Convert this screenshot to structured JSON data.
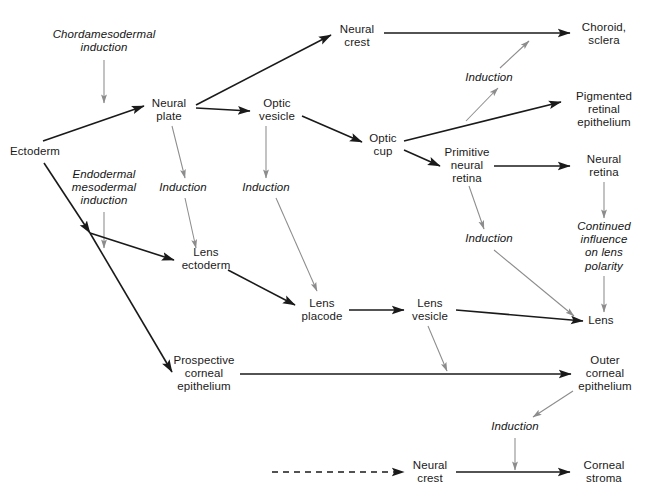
{
  "diagram": {
    "width": 648,
    "height": 504,
    "background": "#ffffff",
    "colors": {
      "tissue_arrow": "#1a1a1a",
      "induction_arrow": "#8c8c8c",
      "text": "#1a1a1a"
    },
    "nodes": [
      {
        "id": "chordamesodermal_induction",
        "label": "Chordamesodermal\ninduction",
        "type": "induction",
        "x": 104,
        "y": 41
      },
      {
        "id": "ectoderm",
        "label": "Ectoderm",
        "type": "tissue",
        "x": 35,
        "y": 152
      },
      {
        "id": "neural_plate",
        "label": "Neural\nplate",
        "type": "tissue",
        "x": 169,
        "y": 110
      },
      {
        "id": "neural_crest_top",
        "label": "Neural\ncrest",
        "type": "tissue",
        "x": 357,
        "y": 36
      },
      {
        "id": "optic_vesicle",
        "label": "Optic\nvesicle",
        "type": "tissue",
        "x": 277,
        "y": 110
      },
      {
        "id": "optic_cup",
        "label": "Optic\ncup",
        "type": "tissue",
        "x": 383,
        "y": 145
      },
      {
        "id": "choroid_sclera",
        "label": "Choroid,\nsclera",
        "type": "tissue",
        "x": 604,
        "y": 34
      },
      {
        "id": "induction_choroid",
        "label": "Induction",
        "type": "induction",
        "x": 489,
        "y": 78
      },
      {
        "id": "pigmented_retinal_epithelium",
        "label": "Pigmented\nretinal\nepithelium",
        "type": "tissue",
        "x": 604,
        "y": 110
      },
      {
        "id": "primitive_neural_retina",
        "label": "Primitive\nneural\nretina",
        "type": "tissue",
        "x": 467,
        "y": 166
      },
      {
        "id": "neural_retina",
        "label": "Neural\nretina",
        "type": "tissue",
        "x": 604,
        "y": 166
      },
      {
        "id": "endodermal_mesodermal_induction",
        "label": "Endodermal\nmesodermal\ninduction",
        "type": "induction",
        "x": 104,
        "y": 188
      },
      {
        "id": "induction_lens_ectoderm",
        "label": "Induction",
        "type": "induction",
        "x": 183,
        "y": 188
      },
      {
        "id": "induction_optic_vesicle",
        "label": "Induction",
        "type": "induction",
        "x": 266,
        "y": 188
      },
      {
        "id": "induction_retina_lens",
        "label": "Induction",
        "type": "induction",
        "x": 489,
        "y": 239
      },
      {
        "id": "continued_influence",
        "label": "Continued\ninfluence\non lens\npolarity",
        "type": "induction",
        "x": 604,
        "y": 246
      },
      {
        "id": "lens_ectoderm",
        "label": "Lens\nectoderm",
        "type": "tissue",
        "x": 206,
        "y": 259
      },
      {
        "id": "lens_placode",
        "label": "Lens\nplacode",
        "type": "tissue",
        "x": 322,
        "y": 310
      },
      {
        "id": "lens_vesicle",
        "label": "Lens\nvesicle",
        "type": "tissue",
        "x": 430,
        "y": 310
      },
      {
        "id": "lens",
        "label": "Lens",
        "type": "tissue",
        "x": 601,
        "y": 321
      },
      {
        "id": "prospective_corneal_epithelium",
        "label": "Prospective\ncorneal\nepithelium",
        "type": "tissue",
        "x": 204,
        "y": 374
      },
      {
        "id": "outer_corneal_epithelium",
        "label": "Outer\ncorneal\nepithelium",
        "type": "tissue",
        "x": 605,
        "y": 374
      },
      {
        "id": "induction_corneal_stroma",
        "label": "Induction",
        "type": "induction",
        "x": 515,
        "y": 427
      },
      {
        "id": "neural_crest_bottom",
        "label": "Neural\ncrest",
        "type": "tissue",
        "x": 430,
        "y": 472
      },
      {
        "id": "corneal_stroma",
        "label": "Corneal\nstroma",
        "type": "tissue",
        "x": 604,
        "y": 472
      }
    ],
    "edges": [
      {
        "id": "chordamesodermal-to-plate",
        "from": "chordamesodermal_induction",
        "to": "neural_plate",
        "style": "induction",
        "kind": "straight",
        "x1": 104,
        "y1": 60,
        "x2": 104,
        "y2": 103
      },
      {
        "id": "ectoderm-to-neural-plate",
        "from": "ectoderm",
        "to": "neural_plate",
        "style": "tissue",
        "kind": "straight",
        "x1": 43,
        "y1": 141,
        "x2": 144,
        "y2": 106
      },
      {
        "id": "neural-plate-to-neural-crest",
        "from": "neural_plate",
        "to": "neural_crest_top",
        "style": "tissue",
        "kind": "straight",
        "x1": 196,
        "y1": 105,
        "x2": 331,
        "y2": 35
      },
      {
        "id": "neural-plate-to-optic-vesicle",
        "from": "neural_plate",
        "to": "optic_vesicle",
        "style": "tissue",
        "kind": "straight",
        "x1": 196,
        "y1": 108,
        "x2": 250,
        "y2": 111
      },
      {
        "id": "neural-plate-to-induction-lens",
        "from": "neural_plate",
        "to": "induction_lens_ectoderm",
        "style": "induction",
        "kind": "straight",
        "x1": 172,
        "y1": 126,
        "x2": 185,
        "y2": 178
      },
      {
        "id": "optic-vesicle-to-optic-cup",
        "from": "optic_vesicle",
        "to": "optic_cup",
        "style": "tissue",
        "kind": "straight",
        "x1": 302,
        "y1": 116,
        "x2": 362,
        "y2": 142
      },
      {
        "id": "optic-vesicle-to-induction",
        "from": "optic_vesicle",
        "to": "induction_optic_vesicle",
        "style": "induction",
        "kind": "straight",
        "x1": 266,
        "y1": 126,
        "x2": 266,
        "y2": 178
      },
      {
        "id": "neural-crest-to-choroid",
        "from": "neural_crest_top",
        "to": "choroid_sclera",
        "style": "tissue",
        "kind": "straight",
        "x1": 384,
        "y1": 33,
        "x2": 570,
        "y2": 33
      },
      {
        "id": "optic-cup-to-pigmented",
        "from": "optic_cup",
        "to": "pigmented_retinal_epithelium",
        "style": "tissue",
        "kind": "straight",
        "x1": 404,
        "y1": 141,
        "x2": 561,
        "y2": 102
      },
      {
        "id": "optic-cup-to-primitive-retina",
        "from": "optic_cup",
        "to": "primitive_neural_retina",
        "style": "tissue",
        "kind": "straight",
        "x1": 404,
        "y1": 150,
        "x2": 440,
        "y2": 166
      },
      {
        "id": "induction-to-choroid-line",
        "from": "optic_cup",
        "to": "induction_choroid",
        "style": "induction",
        "kind": "straight",
        "x1": 466,
        "y1": 121,
        "x2": 498,
        "y2": 88
      },
      {
        "id": "induction-choroid-upward",
        "from": "induction_choroid",
        "to": "neural_crest_to_choroid_line",
        "style": "induction",
        "kind": "straight",
        "x1": 500,
        "y1": 68,
        "x2": 529,
        "y2": 41
      },
      {
        "id": "primitive-retina-to-neural-retina",
        "from": "primitive_neural_retina",
        "to": "neural_retina",
        "style": "tissue",
        "kind": "straight",
        "x1": 494,
        "y1": 166,
        "x2": 570,
        "y2": 166
      },
      {
        "id": "primitive-retina-to-induction",
        "from": "primitive_neural_retina",
        "to": "induction_retina_lens",
        "style": "induction",
        "kind": "straight",
        "x1": 469,
        "y1": 186,
        "x2": 484,
        "y2": 229
      },
      {
        "id": "neural-retina-to-continued",
        "from": "neural_retina",
        "to": "continued_influence",
        "style": "induction",
        "kind": "straight",
        "x1": 604,
        "y1": 182,
        "x2": 604,
        "y2": 218
      },
      {
        "id": "continued-to-lens",
        "from": "continued_influence",
        "to": "lens",
        "style": "induction",
        "kind": "straight",
        "x1": 604,
        "y1": 276,
        "x2": 604,
        "y2": 312
      },
      {
        "id": "induction-retina-lens-to-lens",
        "from": "induction_retina_lens",
        "to": "lens",
        "style": "induction",
        "kind": "straight",
        "x1": 494,
        "y1": 250,
        "x2": 574,
        "y2": 316
      },
      {
        "id": "endodermal-to-lens-ectoderm",
        "from": "endodermal_mesodermal_induction",
        "to": "lens_ectoderm",
        "style": "induction",
        "kind": "straight",
        "x1": 104,
        "y1": 212,
        "x2": 104,
        "y2": 248
      },
      {
        "id": "induction-lens-to-lens-ectoderm",
        "from": "induction_lens_ectoderm",
        "to": "lens_ectoderm",
        "style": "induction",
        "kind": "straight",
        "x1": 185,
        "y1": 198,
        "x2": 196,
        "y2": 248
      },
      {
        "id": "ectoderm-to-branch",
        "from": "ectoderm",
        "to": "branch_point",
        "style": "tissue",
        "kind": "straight",
        "x1": 44,
        "y1": 163,
        "x2": 90,
        "y2": 233
      },
      {
        "id": "branch-to-lens-ectoderm",
        "from": "branch_point",
        "to": "lens_ectoderm",
        "style": "tissue",
        "kind": "straight",
        "x1": 90,
        "y1": 233,
        "x2": 174,
        "y2": 260
      },
      {
        "id": "branch-to-prospective-cornea",
        "from": "branch_point",
        "to": "prospective_corneal_epithelium",
        "style": "tissue",
        "kind": "straight",
        "x1": 90,
        "y1": 233,
        "x2": 172,
        "y2": 372
      },
      {
        "id": "lens-ectoderm-to-lens-placode",
        "from": "lens_ectoderm",
        "to": "lens_placode",
        "style": "tissue",
        "kind": "straight",
        "x1": 228,
        "y1": 270,
        "x2": 295,
        "y2": 305
      },
      {
        "id": "induction-optic-to-lens-placode",
        "from": "induction_optic_vesicle",
        "to": "lens_placode",
        "style": "induction",
        "kind": "straight",
        "x1": 276,
        "y1": 198,
        "x2": 317,
        "y2": 291
      },
      {
        "id": "lens-placode-to-lens-vesicle",
        "from": "lens_placode",
        "to": "lens_vesicle",
        "style": "tissue",
        "kind": "straight",
        "x1": 349,
        "y1": 310,
        "x2": 404,
        "y2": 310
      },
      {
        "id": "lens-vesicle-to-lens",
        "from": "lens_vesicle",
        "to": "lens",
        "style": "tissue",
        "kind": "straight",
        "x1": 456,
        "y1": 310,
        "x2": 583,
        "y2": 321
      },
      {
        "id": "lens-vesicle-to-cornea-line",
        "from": "lens_vesicle",
        "to": "corneal_line",
        "style": "induction",
        "kind": "straight",
        "x1": 428,
        "y1": 326,
        "x2": 447,
        "y2": 371
      },
      {
        "id": "prospective-to-outer-cornea",
        "from": "prospective_corneal_epithelium",
        "to": "outer_corneal_epithelium",
        "style": "tissue",
        "kind": "straight",
        "x1": 240,
        "y1": 374,
        "x2": 571,
        "y2": 374
      },
      {
        "id": "outer-cornea-to-induction",
        "from": "outer_corneal_epithelium",
        "to": "induction_corneal_stroma",
        "style": "induction",
        "kind": "straight",
        "x1": 573,
        "y1": 391,
        "x2": 533,
        "y2": 417
      },
      {
        "id": "induction-to-corneal-stroma-line",
        "from": "induction_corneal_stroma",
        "to": "neural_crest_to_stroma_line",
        "style": "induction",
        "kind": "straight",
        "x1": 515,
        "y1": 438,
        "x2": 515,
        "y2": 470
      },
      {
        "id": "dashed-to-neural-crest",
        "from": "source_unspecified",
        "to": "neural_crest_bottom",
        "style": "tissue",
        "kind": "dashed",
        "x1": 272,
        "y1": 472,
        "x2": 404,
        "y2": 472
      },
      {
        "id": "neural-crest-to-corneal-stroma",
        "from": "neural_crest_bottom",
        "to": "corneal_stroma",
        "style": "tissue",
        "kind": "straight",
        "x1": 456,
        "y1": 472,
        "x2": 570,
        "y2": 472
      }
    ]
  }
}
